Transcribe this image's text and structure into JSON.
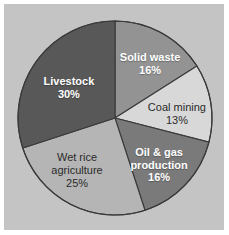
{
  "figure": {
    "background_color": "#c4c4c4",
    "page_color": "#ffffff",
    "outline_color": "#3a3a3a"
  },
  "chart_data": {
    "type": "pie",
    "title": "",
    "xlabel": "",
    "ylabel": "",
    "legend_position": "none",
    "grid": false,
    "units": "%",
    "start_angle_deg": 0,
    "direction": "clockwise",
    "categories": [
      "Solid waste",
      "Coal mining",
      "Oil & gas production",
      "Wet rice agriculture",
      "Livestock"
    ],
    "values": [
      16,
      13,
      16,
      25,
      30
    ],
    "slices": [
      {
        "label": "Solid waste",
        "value": 16,
        "value_text": "16%",
        "color": "#939393",
        "text_color": "#ffffff",
        "text_style": "bold",
        "label_x_pct": 66.4,
        "label_y_pct": 26.5
      },
      {
        "label": "Coal mining",
        "value": 13,
        "value_text": "13%",
        "color": "#d8d8d8",
        "text_color": "#2b2b2b",
        "text_style": "normal",
        "label_x_pct": 78.6,
        "label_y_pct": 48.7
      },
      {
        "label": "Oil & gas production",
        "value": 16,
        "value_text": "16%",
        "color": "#7a7a7a",
        "text_color": "#ffffff",
        "text_style": "bold",
        "label_x_pct": 70.5,
        "label_y_pct": 71.2,
        "line1": "Oil & gas",
        "line2": "production"
      },
      {
        "label": "Wet rice agriculture",
        "value": 25,
        "value_text": "25%",
        "color": "#b5b5b5",
        "text_color": "#2b2b2b",
        "text_style": "normal",
        "label_x_pct": 33.2,
        "label_y_pct": 73.5,
        "line1": "Wet rice",
        "line2": "agriculture"
      },
      {
        "label": "Livestock",
        "value": 30,
        "value_text": "30%",
        "color": "#585858",
        "text_color": "#ffffff",
        "text_style": "bold",
        "label_x_pct": 29.5,
        "label_y_pct": 37.2
      }
    ]
  }
}
